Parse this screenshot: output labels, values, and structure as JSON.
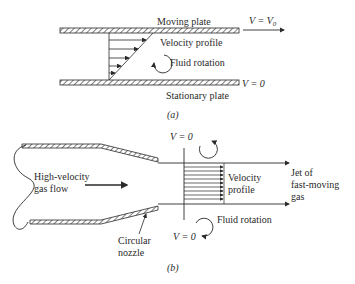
{
  "figure_a": {
    "moving_plate": "Moving plate",
    "top_velocity": "V = V",
    "top_velocity_sub": "0",
    "velocity_profile": "Velocity profile",
    "fluid_rotation": "Fluid rotation",
    "bottom_velocity": "V = 0",
    "stationary_plate": "Stationary plate",
    "caption": "(a)"
  },
  "figure_b": {
    "flow_label_1": "High-velocity",
    "flow_label_2": "gas flow",
    "top_velocity": "V = 0",
    "velocity_profile_1": "Velocity",
    "velocity_profile_2": "profile",
    "jet_1": "Jet of",
    "jet_2": "fast-moving",
    "jet_3": "gas",
    "fluid_rotation": "Fluid rotation",
    "bottom_velocity": "V = 0",
    "nozzle_1": "Circular",
    "nozzle_2": "nozzle",
    "caption": "(b)"
  },
  "colors": {
    "ink": "#2a2a2a",
    "background": "#ffffff"
  }
}
